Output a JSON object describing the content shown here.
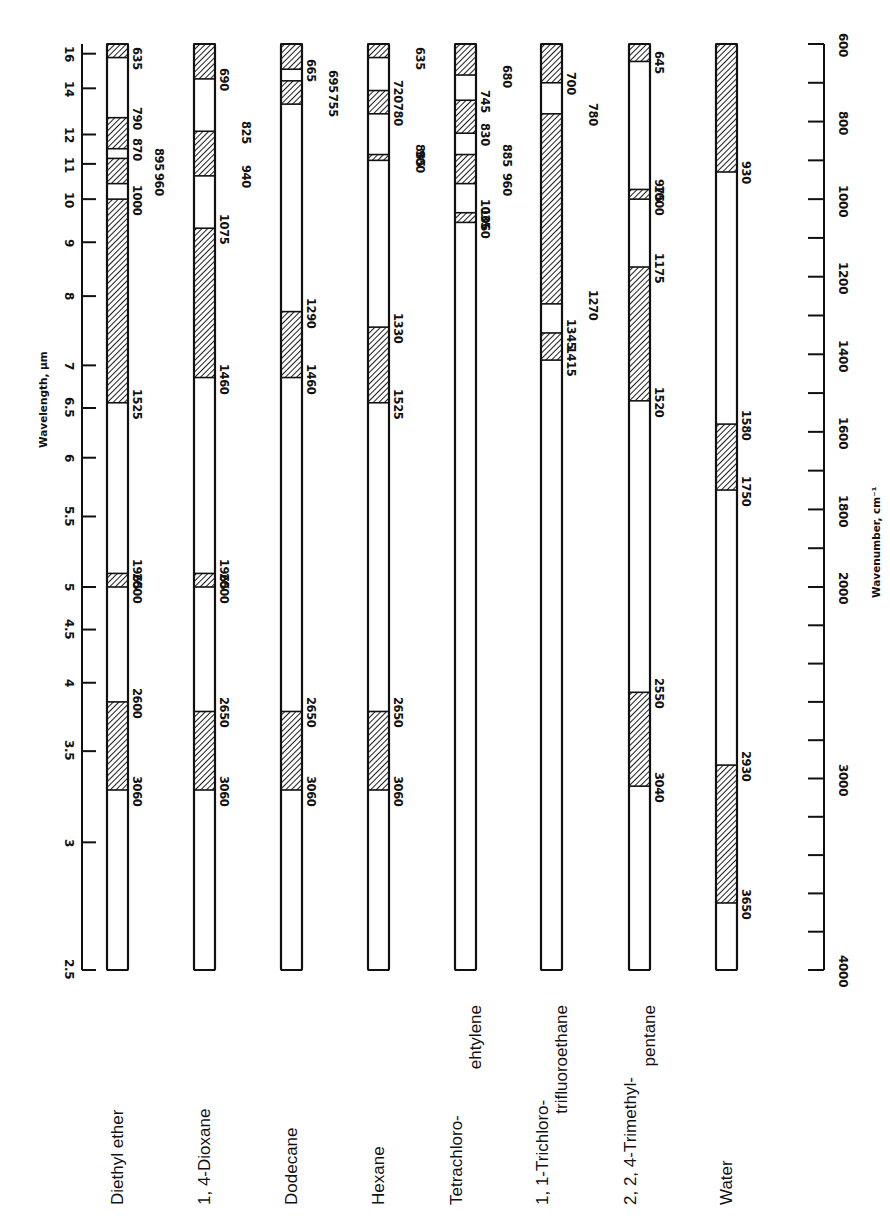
{
  "chart_data": {
    "type": "bar",
    "title": "",
    "orientation": "rotated 90 degrees (vertical columns, one per solvent)",
    "left_axis": {
      "label": "Wavelength, μm",
      "ticks": [
        "16",
        "14",
        "12",
        "11",
        "10",
        "9",
        "8",
        "7",
        "6.5",
        "6",
        "5.5",
        "5",
        "4.5",
        "4",
        "3.5",
        "3",
        "2.5"
      ]
    },
    "right_axis": {
      "label": "Wavenumber, cm⁻¹",
      "range": [
        600,
        4000
      ],
      "ticks": [
        "600",
        "800",
        "1000",
        "1200",
        "1400",
        "1600",
        "1800",
        "2000",
        "3000",
        "4000"
      ]
    },
    "categories": [
      "Diethyl ether",
      "1, 4-Dioxane",
      "Dodecane",
      "Hexane",
      "Tetrachloro-\nehtylene",
      "1, 1-Trichloro-\ntrifluoroethane",
      "2, 2, 4-Trimethyl-\npentane",
      "Water"
    ],
    "series": [
      {
        "name": "Diethyl ether",
        "hatched": [
          [
            600,
            635
          ],
          [
            790,
            870
          ],
          [
            895,
            960
          ],
          [
            1000,
            1525
          ],
          [
            1965,
            2000
          ],
          [
            2600,
            3060
          ]
        ],
        "labels": [
          {
            "v": "635",
            "at": 635,
            "col": 0
          },
          {
            "v": "790",
            "at": 790,
            "col": 0
          },
          {
            "v": "870",
            "at": 870,
            "col": 0
          },
          {
            "v": "895",
            "at": 895,
            "col": 1
          },
          {
            "v": "960",
            "at": 960,
            "col": 1
          },
          {
            "v": "1000",
            "at": 1000,
            "col": 0
          },
          {
            "v": "1525",
            "at": 1525,
            "col": 0
          },
          {
            "v": "1965",
            "at": 1965,
            "col": 0
          },
          {
            "v": "2000",
            "at": 2000,
            "col": 0
          },
          {
            "v": "2600",
            "at": 2600,
            "col": 0
          },
          {
            "v": "3060",
            "at": 3060,
            "col": 0
          }
        ]
      },
      {
        "name": "1, 4-Dioxane",
        "hatched": [
          [
            600,
            690
          ],
          [
            825,
            940
          ],
          [
            1075,
            1460
          ],
          [
            1965,
            2000
          ],
          [
            2650,
            3060
          ]
        ],
        "labels": [
          {
            "v": "690",
            "at": 690,
            "col": 0
          },
          {
            "v": "825",
            "at": 825,
            "col": 1
          },
          {
            "v": "940",
            "at": 940,
            "col": 1
          },
          {
            "v": "1075",
            "at": 1075,
            "col": 0
          },
          {
            "v": "1460",
            "at": 1460,
            "col": 0
          },
          {
            "v": "1965",
            "at": 1965,
            "col": 0
          },
          {
            "v": "2000",
            "at": 2000,
            "col": 0
          },
          {
            "v": "2650",
            "at": 2650,
            "col": 0
          },
          {
            "v": "3060",
            "at": 3060,
            "col": 0
          }
        ]
      },
      {
        "name": "Dodecane",
        "hatched": [
          [
            600,
            665
          ],
          [
            695,
            755
          ],
          [
            1290,
            1460
          ],
          [
            2650,
            3060
          ]
        ],
        "labels": [
          {
            "v": "665",
            "at": 665,
            "col": 0
          },
          {
            "v": "695",
            "at": 695,
            "col": 1
          },
          {
            "v": "755",
            "at": 755,
            "col": 1
          },
          {
            "v": "1290",
            "at": 1290,
            "col": 0
          },
          {
            "v": "1460",
            "at": 1460,
            "col": 0
          },
          {
            "v": "2650",
            "at": 2650,
            "col": 0
          },
          {
            "v": "3060",
            "at": 3060,
            "col": 0
          }
        ]
      },
      {
        "name": "Hexane",
        "hatched": [
          [
            600,
            635
          ],
          [
            720,
            780
          ],
          [
            885,
            900
          ],
          [
            1330,
            1525
          ],
          [
            2650,
            3060
          ]
        ],
        "labels": [
          {
            "v": "635",
            "at": 635,
            "col": 1
          },
          {
            "v": "720",
            "at": 720,
            "col": 0
          },
          {
            "v": "780",
            "at": 780,
            "col": 0
          },
          {
            "v": "885",
            "at": 885,
            "col": 1
          },
          {
            "v": "900",
            "at": 900,
            "col": 1
          },
          {
            "v": "1330",
            "at": 1330,
            "col": 0
          },
          {
            "v": "1525",
            "at": 1525,
            "col": 0
          },
          {
            "v": "2650",
            "at": 2650,
            "col": 0
          },
          {
            "v": "3060",
            "at": 3060,
            "col": 0
          }
        ]
      },
      {
        "name": "Tetrachloroethylene",
        "hatched": [
          [
            600,
            680
          ],
          [
            745,
            830
          ],
          [
            885,
            960
          ],
          [
            1035,
            1060
          ]
        ],
        "labels": [
          {
            "v": "680",
            "at": 680,
            "col": 1
          },
          {
            "v": "745",
            "at": 745,
            "col": 0
          },
          {
            "v": "830",
            "at": 830,
            "col": 0
          },
          {
            "v": "885",
            "at": 885,
            "col": 1
          },
          {
            "v": "960",
            "at": 960,
            "col": 1
          },
          {
            "v": "1035",
            "at": 1035,
            "col": 0
          },
          {
            "v": "1060",
            "at": 1060,
            "col": 0
          }
        ]
      },
      {
        "name": "1, 1-Trichlorotrifluoroethane",
        "hatched": [
          [
            600,
            700
          ],
          [
            780,
            1270
          ],
          [
            1345,
            1415
          ]
        ],
        "labels": [
          {
            "v": "700",
            "at": 700,
            "col": 0
          },
          {
            "v": "780",
            "at": 780,
            "col": 1
          },
          {
            "v": "1270",
            "at": 1270,
            "col": 1
          },
          {
            "v": "1345",
            "at": 1345,
            "col": 0
          },
          {
            "v": "1415",
            "at": 1415,
            "col": 0
          }
        ]
      },
      {
        "name": "2, 2, 4-Trimethylpentane",
        "hatched": [
          [
            600,
            645
          ],
          [
            975,
            1000
          ],
          [
            1175,
            1520
          ],
          [
            2550,
            3040
          ]
        ],
        "labels": [
          {
            "v": "645",
            "at": 645,
            "col": 0
          },
          {
            "v": "975",
            "at": 975,
            "col": 0
          },
          {
            "v": "1000",
            "at": 1000,
            "col": 0
          },
          {
            "v": "1175",
            "at": 1175,
            "col": 0
          },
          {
            "v": "1520",
            "at": 1520,
            "col": 0
          },
          {
            "v": "2550",
            "at": 2550,
            "col": 0
          },
          {
            "v": "3040",
            "at": 3040,
            "col": 0
          }
        ]
      },
      {
        "name": "Water",
        "hatched": [
          [
            600,
            930
          ],
          [
            1580,
            1750
          ],
          [
            2930,
            3650
          ]
        ],
        "labels": [
          {
            "v": "930",
            "at": 930,
            "col": 0
          },
          {
            "v": "1580",
            "at": 1580,
            "col": 0
          },
          {
            "v": "1750",
            "at": 1750,
            "col": 0
          },
          {
            "v": "2930",
            "at": 2930,
            "col": 0
          },
          {
            "v": "3650",
            "at": 3650,
            "col": 0
          }
        ]
      }
    ],
    "xlabel": "Wavenumber, cm⁻¹",
    "ylabel": "Wavelength, μm",
    "grid": false,
    "legend": null
  },
  "axes": {
    "left_title": "Wavelength, μm",
    "right_title": "Wavenumber, cm⁻¹"
  },
  "solvents": [
    {
      "line1": "Diethyl ether",
      "line2": ""
    },
    {
      "line1": "1, 4-Dioxane",
      "line2": ""
    },
    {
      "line1": "Dodecane",
      "line2": ""
    },
    {
      "line1": "Hexane",
      "line2": ""
    },
    {
      "line1": "Tetrachloro-",
      "line2": "ehtylene"
    },
    {
      "line1": "1, 1-Trichloro-",
      "line2": "trifluoroethane"
    },
    {
      "line1": "2, 2, 4-Trimethyl-",
      "line2": "pentane"
    },
    {
      "line1": "Water",
      "line2": ""
    }
  ],
  "colors": {
    "ink": "#111111",
    "paper": "#ffffff"
  }
}
